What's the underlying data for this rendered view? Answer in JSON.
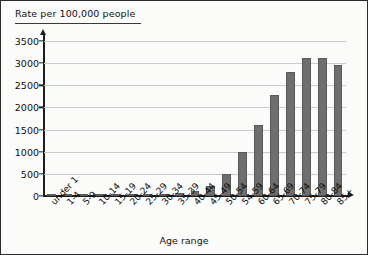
{
  "chart_data": {
    "type": "bar",
    "title": "",
    "ylabel": "Rate per 100,000 people",
    "xlabel": "Age range",
    "ylim": [
      0,
      3750
    ],
    "yticks": [
      0,
      500,
      1000,
      1500,
      2000,
      2500,
      3000,
      3500
    ],
    "ytick_labels": [
      "0",
      "500",
      "1000",
      "1500",
      "2000",
      "2500",
      "3000",
      "3500"
    ],
    "grid": true,
    "legend": "none",
    "bar_color": "#6e6e6e",
    "categories": [
      "under 1",
      "1-4",
      "5-9",
      "10-14",
      "15-19",
      "20-24",
      "25-29",
      "30-34",
      "35-39",
      "40-44",
      "45-49",
      "50-54",
      "54-59",
      "60-64",
      "65-69",
      "70-74",
      "75-79",
      "80-84",
      "85+"
    ],
    "values": [
      10,
      5,
      5,
      5,
      10,
      15,
      20,
      35,
      60,
      110,
      220,
      500,
      1000,
      1600,
      2270,
      2790,
      3120,
      3120,
      2950
    ]
  }
}
